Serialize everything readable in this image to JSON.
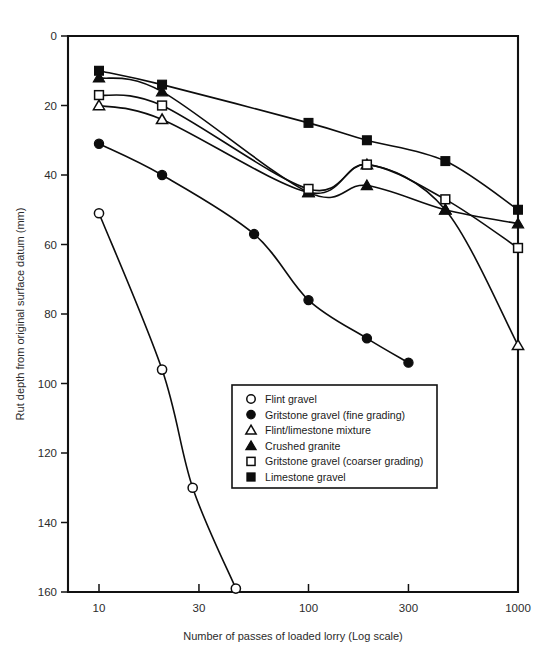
{
  "chart_data": {
    "type": "line",
    "title": "",
    "xlabel": "Number of passes of loaded lorry (Log scale)",
    "ylabel": "Rut depth from original surface datum (mm)",
    "xscale": "log",
    "xlim": [
      8.5,
      1000
    ],
    "ylim": [
      0,
      160
    ],
    "xticks": [
      10,
      30,
      100,
      300,
      1000
    ],
    "xticklabels": [
      "10",
      "30",
      "100",
      "300",
      "1000"
    ],
    "yticks": [
      0,
      20,
      40,
      60,
      80,
      100,
      120,
      140,
      160
    ],
    "yticklabels": [
      "0",
      "20",
      "40",
      "60",
      "80",
      "100",
      "120",
      "140",
      "160"
    ],
    "y_axis_inverted": true,
    "grid": false,
    "legend_position": "center",
    "series": [
      {
        "name": "Flint gravel",
        "marker": "open-circle",
        "x": [
          10,
          20,
          28,
          45
        ],
        "y": [
          51,
          96,
          130,
          159
        ]
      },
      {
        "name": "Gritstone gravel (fine grading)",
        "marker": "filled-circle",
        "x": [
          10,
          20,
          55,
          100,
          190,
          300
        ],
        "y": [
          31,
          40,
          57,
          76,
          87,
          94
        ]
      },
      {
        "name": "Flint/limestone mixture",
        "marker": "open-triangle",
        "x": [
          10,
          20,
          100,
          190,
          450,
          1000
        ],
        "y": [
          20,
          24,
          45,
          37,
          50,
          89
        ]
      },
      {
        "name": "Crushed granite",
        "marker": "filled-triangle",
        "x": [
          10,
          20,
          100,
          190,
          450,
          1000
        ],
        "y": [
          12,
          16,
          45,
          43,
          50,
          54
        ]
      },
      {
        "name": "Gritstone gravel (coarser grading)",
        "marker": "open-square",
        "x": [
          10,
          20,
          100,
          190,
          450,
          1000
        ],
        "y": [
          17,
          20,
          44,
          37,
          47,
          61
        ]
      },
      {
        "name": "Limestone gravel",
        "marker": "filled-square",
        "x": [
          10,
          20,
          100,
          190,
          450,
          1000
        ],
        "y": [
          10,
          14,
          25,
          30,
          36,
          50
        ]
      }
    ]
  },
  "legend": {
    "items": [
      {
        "marker": "open-circle",
        "label": "Flint gravel"
      },
      {
        "marker": "filled-circle",
        "label": "Gritstone gravel (fine grading)"
      },
      {
        "marker": "open-triangle",
        "label": "Flint/limestone mixture"
      },
      {
        "marker": "filled-triangle",
        "label": "Crushed granite"
      },
      {
        "marker": "open-square",
        "label": "Gritstone gravel (coarser grading)"
      },
      {
        "marker": "filled-square",
        "label": "Limestone gravel"
      }
    ]
  },
  "colors": {
    "ink": "#0d0d0d",
    "background": "#ffffff",
    "tick_text": "#2b2b2b"
  }
}
